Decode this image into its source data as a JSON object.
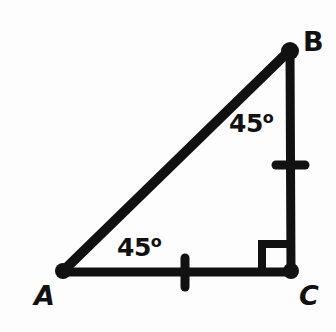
{
  "figure": {
    "name": "right-isosceles-triangle",
    "background_color": "#fdfdfd",
    "stroke_color": "#111111",
    "width": 336,
    "height": 332
  },
  "vertices": [
    {
      "id": "A",
      "label": "A",
      "x": 62,
      "y": 272,
      "label_x": 34,
      "label_y": 282,
      "style": "bold-italic"
    },
    {
      "id": "B",
      "label": "B",
      "x": 290,
      "y": 50,
      "label_x": 303,
      "label_y": 28,
      "style": "bold-upright"
    },
    {
      "id": "C",
      "label": "C",
      "x": 291,
      "y": 272,
      "label_x": 299,
      "label_y": 282,
      "style": "bold-italic"
    }
  ],
  "sides": [
    {
      "id": "AB",
      "from": "A",
      "to": "B",
      "role": "hypotenuse",
      "tick_marks": 0
    },
    {
      "id": "BC",
      "from": "B",
      "to": "C",
      "role": "leg",
      "tick_marks": 1
    },
    {
      "id": "AC",
      "from": "A",
      "to": "C",
      "role": "leg",
      "tick_marks": 1
    }
  ],
  "angles": [
    {
      "at": "A",
      "value": "45",
      "degree_symbol": "o",
      "label": "45°"
    },
    {
      "at": "B",
      "value": "45",
      "degree_symbol": "o",
      "label": "45°"
    },
    {
      "at": "C",
      "value": "90",
      "degree_symbol": "",
      "label": "",
      "marker": "right-angle-square"
    }
  ],
  "labels": {
    "angle_a": {
      "value": "45",
      "degree": "o"
    },
    "angle_b": {
      "value": "45",
      "degree": "o"
    }
  }
}
